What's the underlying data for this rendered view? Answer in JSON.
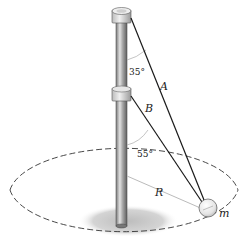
{
  "diagram": {
    "labels": {
      "cord_a": "A",
      "cord_b": "B",
      "radius": "R",
      "mass": "m",
      "angle_a": "35°",
      "angle_b": "55°"
    },
    "colors": {
      "cord": "#1a1a1a",
      "pole_light": "#d8d8d8",
      "pole_dark": "#6e6e6e",
      "shadow": "#c8c8c8",
      "dashed_path": "#333333",
      "radius_line": "#bbbbbb"
    },
    "elements": [
      "vertical-pole",
      "top-collar",
      "middle-collar",
      "cord-a",
      "cord-b",
      "sphere-mass",
      "circular-path",
      "radius-line",
      "ground-shadow"
    ]
  }
}
